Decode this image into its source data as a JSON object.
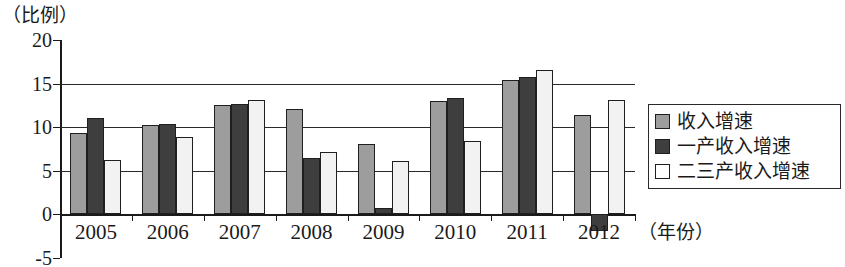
{
  "chart_data": {
    "type": "bar",
    "title": "",
    "subtitle": "",
    "ylabel": "（比例）",
    "xlabel": "（年份）",
    "categories": [
      "2005",
      "2006",
      "2007",
      "2008",
      "2009",
      "2010",
      "2011",
      "2012"
    ],
    "series": [
      {
        "name": "收入增速",
        "color": "#9d9d9d",
        "values": [
          9.3,
          10.2,
          12.5,
          12.1,
          8.0,
          13.0,
          15.4,
          11.4
        ]
      },
      {
        "name": "一产收入增速",
        "color": "#3e3e3e",
        "values": [
          11.0,
          10.3,
          12.6,
          6.4,
          0.7,
          13.3,
          15.8,
          -2.0
        ]
      },
      {
        "name": "二三产收入增速",
        "color": "#ffffff",
        "values": [
          6.2,
          8.9,
          13.1,
          7.1,
          6.1,
          8.4,
          16.5,
          13.1
        ]
      }
    ],
    "ylim": [
      -5,
      20
    ],
    "yticks": [
      20,
      15,
      10,
      5,
      0,
      -5
    ],
    "ytick_labels": [
      "20",
      "15",
      "10",
      "5",
      "0",
      "-5"
    ],
    "gridlines": [
      15,
      10,
      5
    ],
    "grid": true,
    "legend_position": "right",
    "legend_entries": [
      {
        "label": "收入增速",
        "swatch": "gray-swatch-icon"
      },
      {
        "label": "一产收入增速",
        "swatch": "dark-swatch-icon"
      },
      {
        "label": "二三产收入增速",
        "swatch": "white-swatch-icon"
      }
    ]
  }
}
